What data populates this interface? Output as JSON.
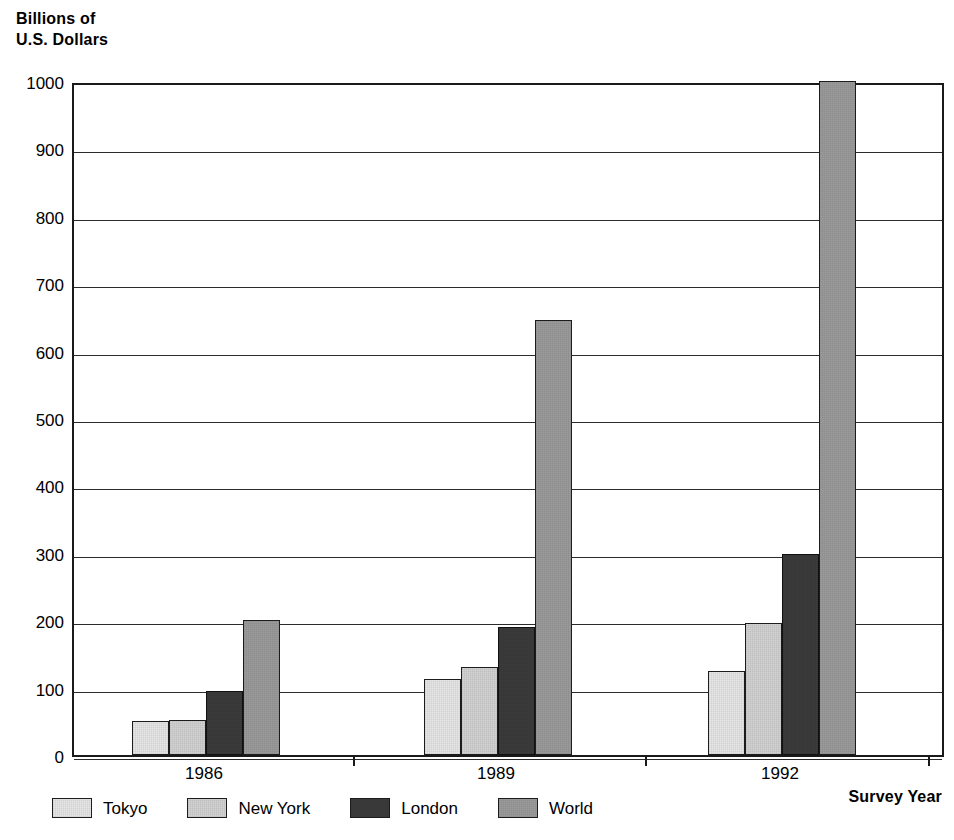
{
  "chart_data": {
    "type": "bar",
    "title": "",
    "subtitle": "",
    "ylabel": "Billions of\nU.S. Dollars",
    "xlabel": "Survey Year",
    "categories": [
      "1986",
      "1989",
      "1992"
    ],
    "series": [
      {
        "name": "Tokyo",
        "color": "#e6e6e6",
        "values": [
          50,
          113,
          125
        ]
      },
      {
        "name": "New York",
        "color": "#d2d2d2",
        "values": [
          52,
          130,
          196
        ]
      },
      {
        "name": "London",
        "color": "#3b3b3b",
        "values": [
          95,
          190,
          298
        ]
      },
      {
        "name": "World",
        "color": "#9b9b9b",
        "values": [
          200,
          645,
          1000
        ]
      }
    ],
    "ylim": [
      0,
      1000
    ],
    "ytick_step": 100,
    "ytick_labels": [
      "1000",
      "900",
      "800",
      "700",
      "600",
      "500",
      "400",
      "300",
      "200",
      "100",
      "0"
    ],
    "grid": true,
    "grid_axis": "y",
    "legend_position": "bottom-left",
    "xlabel_position": "bottom-right"
  }
}
